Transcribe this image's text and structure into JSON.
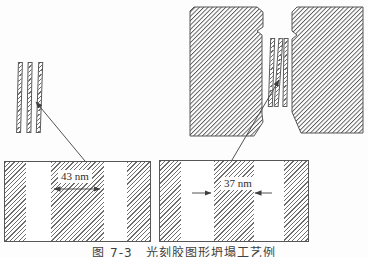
{
  "figure": {
    "caption": "图 7-3　光刻胶图形坍塌工艺例",
    "cross_section_left": {
      "dimension_label": "43 nm"
    },
    "cross_section_right": {
      "dimension_label": "37 nm"
    }
  },
  "colors": {
    "background": "#fdfdfd",
    "line_color": "#545454",
    "hatch_color": "#545454"
  }
}
